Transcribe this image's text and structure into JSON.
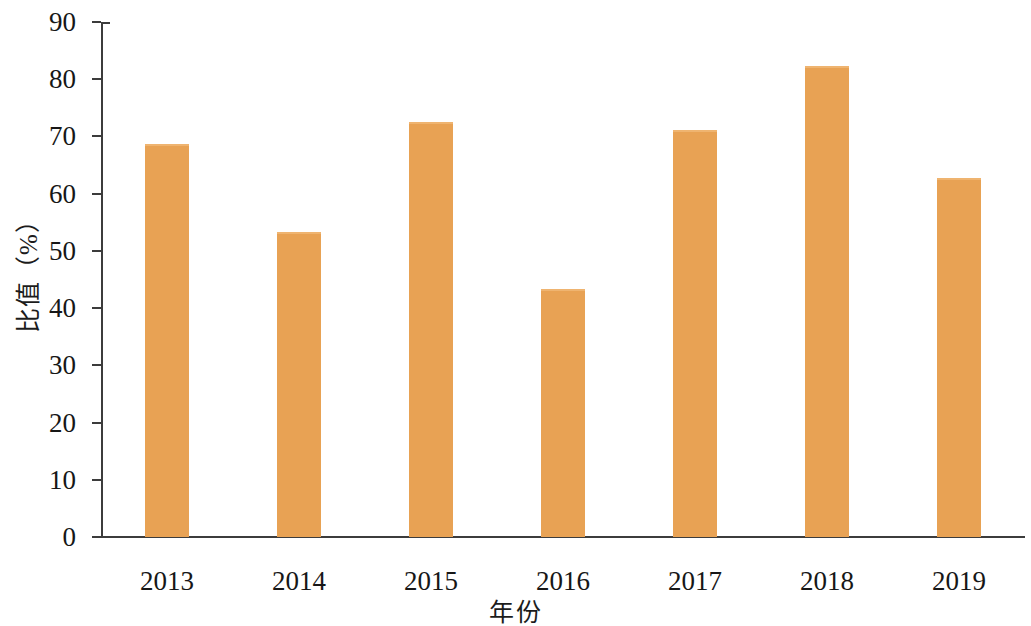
{
  "chart_data": {
    "type": "bar",
    "title": "",
    "xlabel": "年份",
    "ylabel": "比值（%）",
    "categories": [
      "2013",
      "2014",
      "2015",
      "2016",
      "2017",
      "2018",
      "2019"
    ],
    "values": [
      68.7,
      53.3,
      72.5,
      43.4,
      71.2,
      82.3,
      62.7
    ],
    "series": [
      {
        "name": "比值",
        "values": [
          68.7,
          53.3,
          72.5,
          43.4,
          71.2,
          82.3,
          62.7
        ]
      }
    ],
    "ylim": [
      0,
      90
    ],
    "ytick_labels": [
      "0",
      "10",
      "20",
      "30",
      "40",
      "50",
      "60",
      "70",
      "80",
      "90"
    ],
    "ytick_values": [
      0,
      10,
      20,
      30,
      40,
      50,
      60,
      70,
      80,
      90
    ],
    "ytick_step": 10,
    "grid": false,
    "legend": false,
    "legend_position": "none",
    "bar_color": "#e8a254",
    "bar_top_highlight_color": "#efb470",
    "axis_color": "#3c3c3c",
    "text_color": "#171717",
    "background_color": "#ffffff",
    "bar_width_px": 44
  }
}
